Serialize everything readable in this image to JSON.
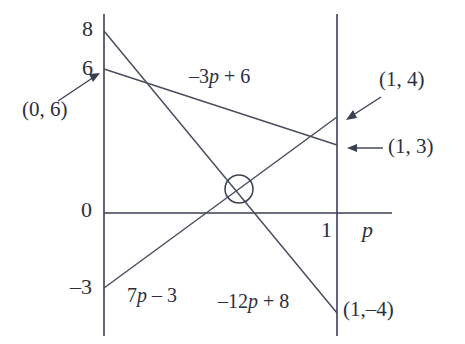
{
  "figure": {
    "background_color": "#ffffff",
    "ink_color": "#3a3f52"
  },
  "axes": {
    "x_axis_label": "p",
    "x_axis_name": "horizontal axis p",
    "y_axis_name": "vertical value axis",
    "x_ticks": [
      {
        "label": "1",
        "value": 1
      }
    ],
    "y_ticks": [
      {
        "label": "8",
        "value": 8
      },
      {
        "label": "6",
        "value": 6
      },
      {
        "label": "0",
        "value": 0
      },
      {
        "label": "–3",
        "value": -3
      }
    ],
    "xlim": [
      0,
      1.25
    ],
    "ylim": [
      -5,
      8.6
    ]
  },
  "chart_data": {
    "type": "line",
    "title": "",
    "xlabel": "p",
    "ylabel": "",
    "xlim": [
      0,
      1.25
    ],
    "ylim": [
      -5,
      8.6
    ],
    "grid": false,
    "legend": "inline-labels",
    "x": [
      0,
      1
    ],
    "series": [
      {
        "name": "–3p + 6",
        "label": "–3p + 6",
        "slope": -3,
        "intercept": 6,
        "values": [
          6,
          3
        ],
        "endpoints": [
          [
            0,
            6
          ],
          [
            1,
            3
          ]
        ]
      },
      {
        "name": "7p – 3",
        "label": "7p – 3",
        "slope": 7,
        "intercept": -3,
        "values": [
          -3,
          4
        ],
        "endpoints": [
          [
            0,
            -3
          ],
          [
            1,
            4
          ]
        ]
      },
      {
        "name": "–12p + 8",
        "label": "–12p + 8",
        "slope": -12,
        "intercept": 8,
        "values": [
          8,
          -4
        ],
        "endpoints": [
          [
            0,
            8
          ],
          [
            1,
            -4
          ]
        ]
      }
    ],
    "annotations": [
      {
        "text": "(0, 6)",
        "point": [
          0,
          6
        ],
        "arrow": true
      },
      {
        "text": "(1, 4)",
        "point": [
          1,
          4
        ],
        "arrow": true
      },
      {
        "text": "(1, 3)",
        "point": [
          1,
          3
        ],
        "arrow": true
      },
      {
        "text": "(1,–4)",
        "point": [
          1,
          -4
        ],
        "arrow": false
      }
    ],
    "markers": [
      {
        "kind": "circle",
        "point": [
          0.578947,
          1.052632
        ],
        "note": "intersection of 7p – 3 and –12p + 8"
      }
    ]
  },
  "labels": {
    "eq_top": "–3p + 6",
    "eq_rising": "7p – 3",
    "eq_falling": "–12p + 8",
    "point_0_6": "(0, 6)",
    "point_1_4": "(1, 4)",
    "point_1_3": "(1, 3)",
    "point_1_m4": "(1,–4)",
    "tick_8": "8",
    "tick_6": "6",
    "tick_0": "0",
    "tick_m3": "–3",
    "tick_1": "1",
    "axis_p": "p"
  }
}
